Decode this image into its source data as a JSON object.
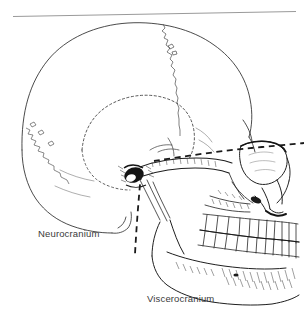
{
  "figure": {
    "type": "anatomical-line-drawing",
    "background_color": "#ffffff",
    "ink_color": "#1a1a1a",
    "label_color": "#3a3a3a",
    "rule_color": "#9a9a9a",
    "width": 304,
    "height": 323
  },
  "labels": {
    "neurocranium": "Neurocranium",
    "viscerocranium": "Viscerocranium"
  },
  "annotations": {
    "divider_style": "dashed",
    "divider_description": "dashed line separating neurocranium from viscerocranium",
    "horizontal_rule_description": "thin gray rule across top of figure"
  },
  "structures": [
    "calvaria",
    "coronal-suture",
    "lambdoid-suture",
    "squamous-suture",
    "temporal-fossa",
    "external-acoustic-meatus",
    "mastoid-process",
    "zygomatic-arch",
    "orbit",
    "nasal-aperture",
    "maxilla",
    "upper-teeth",
    "lower-teeth",
    "mandible",
    "mandibular-ramus",
    "mandibular-angle",
    "mental-protuberance"
  ]
}
